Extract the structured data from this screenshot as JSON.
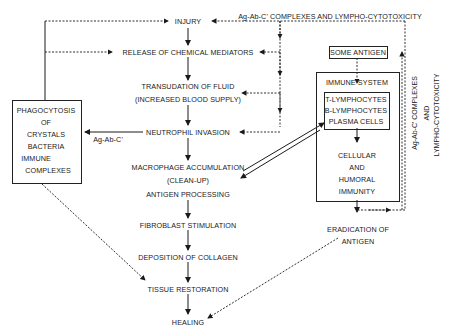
{
  "diagram": {
    "main_flow": [
      {
        "id": "injury",
        "label": "INJURY"
      },
      {
        "id": "release",
        "label": "RELEASE OF CHEMICAL MEDIATORS"
      },
      {
        "id": "transudation",
        "label": "TRANSUDATION OF FLUID"
      },
      {
        "id": "transudation_sub",
        "label": "(INCREASED BLOOD SUPPLY)"
      },
      {
        "id": "neutrophil",
        "label": "NEUTROPHIL INVASION"
      },
      {
        "id": "macrophage",
        "label": "MACROPHAGE ACCUMULATION"
      },
      {
        "id": "cleanup",
        "label": "(CLEAN-UP)"
      },
      {
        "id": "antigen_processing",
        "label": "ANTIGEN PROCESSING"
      },
      {
        "id": "fibroblast",
        "label": "FIBROBLAST STIMULATION"
      },
      {
        "id": "collagen",
        "label": "DEPOSITION OF COLLAGEN"
      },
      {
        "id": "tissue",
        "label": "TISSUE RESTORATION"
      },
      {
        "id": "healing",
        "label": "HEALING"
      }
    ],
    "phagocytosis_box": {
      "lines": [
        "PHAGOCYTOSIS",
        "OF",
        "CRYSTALS",
        "BACTERIA",
        "IMMUNE",
        "COMPLEXES"
      ]
    },
    "ag_ab_c_label": "Ag-Ab-C'",
    "top_label": "Ag-Ab-C' COMPLEXES AND LYMPHO-CYTOTOXICITY",
    "some_antigen": "SOME ANTIGEN",
    "immune_system": {
      "title": "IMMUNE SYSTEM",
      "cells": [
        "T-LYMPHOCYTES",
        "B-LYMPHOCYTES",
        "PLASMA CELLS"
      ],
      "outcome": [
        "CELLULAR",
        "AND",
        "HUMORAL",
        "IMMUNITY"
      ]
    },
    "eradication": [
      "ERADICATION OF",
      "ANTIGEN"
    ],
    "side_label": [
      "Ag-Ab-C' COMPLEXES",
      "AND",
      "LYMPHO-CYTOTOXICITY"
    ]
  }
}
